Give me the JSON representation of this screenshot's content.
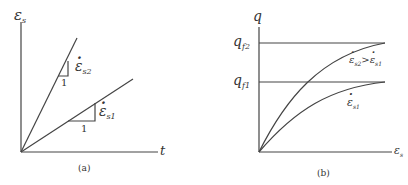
{
  "panels": [
    {
      "id": "a",
      "caption": "(a)",
      "y_axis_label": "ε",
      "y_axis_sub": "s",
      "x_axis_label": "t",
      "lines": [
        {
          "name": "strain-rate-2",
          "label": "ε",
          "label_sub": "s2",
          "slope_run": "1"
        },
        {
          "name": "strain-rate-1",
          "label": "ε",
          "label_sub": "s1",
          "slope_run": "1"
        }
      ]
    },
    {
      "id": "b",
      "caption": "(b)",
      "y_axis_label": "q",
      "x_axis_label": "ε",
      "x_axis_sub": "s",
      "levels": [
        {
          "label": "q",
          "sub": "f2"
        },
        {
          "label": "q",
          "sub": "f1"
        }
      ],
      "curves": [
        {
          "label": "ε̇s2 > ε̇s1",
          "label_a": "ε",
          "label_a_sub": "s2",
          "op": ">",
          "label_b": "ε",
          "label_b_sub": "s1"
        },
        {
          "label": "ε",
          "label_sub": "s1"
        }
      ]
    }
  ]
}
